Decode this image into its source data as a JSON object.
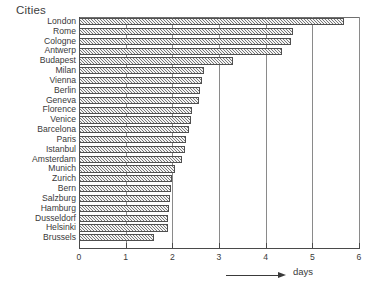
{
  "chart_data": {
    "type": "bar",
    "orientation": "horizontal",
    "title": "",
    "ylabel": "Cities",
    "xlabel": "days",
    "xlim": [
      0,
      6
    ],
    "xticks": [
      0,
      1,
      2,
      3,
      4,
      5,
      6
    ],
    "xtick_labels": [
      "0",
      "1",
      "2",
      "3",
      "4",
      "5",
      "6"
    ],
    "grid": true,
    "grid_axis": "x",
    "legend": false,
    "bar_fill": "gray-hatched",
    "categories": [
      "London",
      "Rome",
      "Cologne",
      "Antwerp",
      "Budapest",
      "Milan",
      "Vienna",
      "Berlin",
      "Geneva",
      "Florence",
      "Venice",
      "Barcelona",
      "Paris",
      "Istanbul",
      "Amsterdam",
      "Munich",
      "Zurich",
      "Bern",
      "Salzburg",
      "Hamburg",
      "Dusseldorf",
      "Helsinki",
      "Brussels"
    ],
    "values": [
      5.67,
      4.58,
      4.55,
      4.35,
      3.3,
      2.68,
      2.63,
      2.6,
      2.58,
      2.42,
      2.4,
      2.35,
      2.3,
      2.28,
      2.2,
      2.05,
      2.0,
      1.98,
      1.95,
      1.93,
      1.9,
      1.9,
      1.6
    ],
    "annotation": "days"
  },
  "axis": {
    "y_title": "Cities",
    "x_label": "days"
  }
}
